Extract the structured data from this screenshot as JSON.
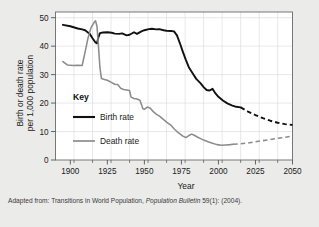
{
  "figure": {
    "background_color": "#ebebea",
    "plot_background_color": "#ffffff",
    "grid_color": "#d9d9d9",
    "axis_color": "#555555"
  },
  "caption": {
    "prefix": "Adapted from: Transitions in World Population, ",
    "italic": "Population Bulletin",
    "suffix": " 59(1): (2004)."
  },
  "legend": {
    "title": "Key",
    "entries": [
      {
        "label": "Birth rate",
        "color": "#111111",
        "width": 1.9,
        "style": "solid"
      },
      {
        "label": "Death rate",
        "color": "#8c8c8c",
        "width": 1.6,
        "style": "solid"
      }
    ]
  },
  "axes": {
    "x_title": "Year",
    "y_title_line1": "Birth or death rate",
    "y_title_line2": "per 1,000 population",
    "x_ticks": [
      "1900",
      "1925",
      "1950",
      "1975",
      "2000",
      "2025",
      "2050"
    ],
    "x_tick_values": [
      1900,
      1925,
      1950,
      1975,
      2000,
      2025,
      2050
    ],
    "x_minor_step": 12.5,
    "y_ticks": [
      "0",
      "10",
      "20",
      "30",
      "40",
      "50"
    ],
    "y_tick_values": [
      0,
      10,
      20,
      30,
      40,
      50
    ]
  },
  "chart_data": {
    "type": "line",
    "title": "",
    "xlabel": "Year",
    "ylabel": "Birth or death rate per 1,000 population",
    "xlim": [
      1890,
      2050
    ],
    "ylim": [
      0,
      52
    ],
    "grid": true,
    "legend_position": "inside-left",
    "series": [
      {
        "name": "Birth rate",
        "color": "#111111",
        "historical": [
          [
            1895,
            47.5
          ],
          [
            1900,
            47.0
          ],
          [
            1905,
            46.2
          ],
          [
            1908,
            45.9
          ],
          [
            1910,
            45.6
          ],
          [
            1913,
            44.4
          ],
          [
            1915,
            42.8
          ],
          [
            1917,
            41.3
          ],
          [
            1918,
            41.0
          ],
          [
            1919,
            43.2
          ],
          [
            1920,
            44.6
          ],
          [
            1922,
            44.8
          ],
          [
            1925,
            44.9
          ],
          [
            1928,
            44.7
          ],
          [
            1930,
            44.4
          ],
          [
            1933,
            44.3
          ],
          [
            1935,
            44.5
          ],
          [
            1938,
            43.8
          ],
          [
            1940,
            44.0
          ],
          [
            1943,
            44.9
          ],
          [
            1945,
            44.3
          ],
          [
            1948,
            45.2
          ],
          [
            1950,
            45.6
          ],
          [
            1953,
            46.0
          ],
          [
            1955,
            46.1
          ],
          [
            1958,
            45.9
          ],
          [
            1960,
            46.0
          ],
          [
            1963,
            45.6
          ],
          [
            1965,
            45.4
          ],
          [
            1968,
            45.3
          ],
          [
            1970,
            45.2
          ],
          [
            1972,
            43.8
          ],
          [
            1974,
            41.0
          ],
          [
            1976,
            38.0
          ],
          [
            1978,
            35.2
          ],
          [
            1980,
            32.6
          ],
          [
            1983,
            30.1
          ],
          [
            1985,
            28.5
          ],
          [
            1988,
            26.9
          ],
          [
            1990,
            25.6
          ],
          [
            1992,
            24.6
          ],
          [
            1994,
            24.4
          ],
          [
            1996,
            25.0
          ],
          [
            1998,
            23.4
          ],
          [
            2000,
            22.2
          ],
          [
            2003,
            20.9
          ],
          [
            2006,
            19.9
          ],
          [
            2009,
            19.2
          ],
          [
            2012,
            18.7
          ],
          [
            2015,
            18.5
          ]
        ],
        "projected": [
          [
            2015,
            18.5
          ],
          [
            2020,
            17.0
          ],
          [
            2025,
            15.8
          ],
          [
            2030,
            14.7
          ],
          [
            2035,
            13.8
          ],
          [
            2040,
            13.1
          ],
          [
            2045,
            12.6
          ],
          [
            2050,
            12.3
          ]
        ]
      },
      {
        "name": "Death rate",
        "color": "#8c8c8c",
        "historical": [
          [
            1895,
            34.6
          ],
          [
            1898,
            33.4
          ],
          [
            1902,
            33.2
          ],
          [
            1905,
            33.3
          ],
          [
            1908,
            33.2
          ],
          [
            1910,
            38.0
          ],
          [
            1912,
            43.0
          ],
          [
            1914,
            46.5
          ],
          [
            1916,
            48.3
          ],
          [
            1917,
            48.9
          ],
          [
            1918,
            47.0
          ],
          [
            1919,
            40.0
          ],
          [
            1920,
            32.5
          ],
          [
            1921,
            28.6
          ],
          [
            1923,
            28.3
          ],
          [
            1925,
            28.0
          ],
          [
            1928,
            27.2
          ],
          [
            1930,
            26.6
          ],
          [
            1932,
            26.5
          ],
          [
            1934,
            25.2
          ],
          [
            1936,
            24.8
          ],
          [
            1938,
            24.6
          ],
          [
            1940,
            24.4
          ],
          [
            1941,
            22.1
          ],
          [
            1943,
            21.6
          ],
          [
            1945,
            21.4
          ],
          [
            1947,
            21.0
          ],
          [
            1949,
            18.0
          ],
          [
            1950,
            17.8
          ],
          [
            1952,
            18.6
          ],
          [
            1954,
            18.2
          ],
          [
            1956,
            17.0
          ],
          [
            1958,
            16.1
          ],
          [
            1960,
            15.5
          ],
          [
            1963,
            14.2
          ],
          [
            1965,
            13.3
          ],
          [
            1968,
            12.2
          ],
          [
            1970,
            11.0
          ],
          [
            1972,
            10.0
          ],
          [
            1974,
            9.2
          ],
          [
            1976,
            8.4
          ],
          [
            1978,
            7.9
          ],
          [
            1980,
            8.6
          ],
          [
            1982,
            9.1
          ],
          [
            1984,
            8.6
          ],
          [
            1986,
            8.0
          ],
          [
            1988,
            7.5
          ],
          [
            1990,
            7.0
          ],
          [
            1993,
            6.4
          ],
          [
            1996,
            5.9
          ],
          [
            1999,
            5.4
          ],
          [
            2002,
            5.2
          ],
          [
            2005,
            5.3
          ],
          [
            2008,
            5.4
          ],
          [
            2010,
            5.5
          ]
        ],
        "projected": [
          [
            2010,
            5.5
          ],
          [
            2015,
            5.7
          ],
          [
            2020,
            6.0
          ],
          [
            2025,
            6.4
          ],
          [
            2030,
            6.8
          ],
          [
            2035,
            7.2
          ],
          [
            2040,
            7.6
          ],
          [
            2045,
            8.0
          ],
          [
            2050,
            8.4
          ]
        ]
      }
    ]
  }
}
